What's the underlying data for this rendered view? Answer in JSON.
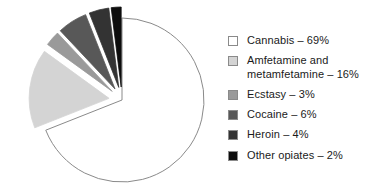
{
  "chart_data": {
    "type": "pie",
    "title": "",
    "subtitle": "",
    "xlabel": "",
    "ylabel": "",
    "legend_position": "right",
    "grid": false,
    "units": "percent",
    "total": 100,
    "categories": [
      "Cannabis",
      "Amfetamine and metamfetamine",
      "Ecstasy",
      "Cocaine",
      "Heroin",
      "Other opiates"
    ],
    "values": [
      69,
      16,
      3,
      6,
      4,
      2
    ],
    "value_labels": [
      "69%",
      "16%",
      "3%",
      "6%",
      "4%",
      "2%"
    ],
    "colors": [
      "#ffffff",
      "#d4d4d4",
      "#9a9a9a",
      "#585858",
      "#333333",
      "#0d0d0d"
    ],
    "slices": [
      {
        "name": "Cannabis",
        "value": 69,
        "value_label": "69%",
        "color": "#ffffff",
        "exploded": false,
        "start_angle": 0,
        "end_angle": 248.4
      },
      {
        "name": "Amfetamine and metamfetamine",
        "value": 16,
        "value_label": "16%",
        "color": "#d4d4d4",
        "exploded": true,
        "start_angle": 248.4,
        "end_angle": 306.0
      },
      {
        "name": "Ecstasy",
        "value": 3,
        "value_label": "3%",
        "color": "#9a9a9a",
        "exploded": true,
        "start_angle": 306.0,
        "end_angle": 316.8
      },
      {
        "name": "Cocaine",
        "value": 6,
        "value_label": "6%",
        "color": "#585858",
        "exploded": true,
        "start_angle": 316.8,
        "end_angle": 338.4
      },
      {
        "name": "Heroin",
        "value": 4,
        "value_label": "4%",
        "color": "#333333",
        "exploded": true,
        "start_angle": 338.4,
        "end_angle": 352.8
      },
      {
        "name": "Other opiates",
        "value": 2,
        "value_label": "2%",
        "color": "#0d0d0d",
        "exploded": true,
        "start_angle": 352.8,
        "end_angle": 360.0
      }
    ]
  },
  "legend": {
    "items": [
      {
        "label": "Cannabis – 69%",
        "color": "#ffffff"
      },
      {
        "label": "Amfetamine and\nmetamfetamine – 16%",
        "color": "#d4d4d4"
      },
      {
        "label": "Ecstasy – 3%",
        "color": "#9a9a9a"
      },
      {
        "label": "Cocaine – 6%",
        "color": "#585858"
      },
      {
        "label": "Heroin – 4%",
        "color": "#333333"
      },
      {
        "label": "Other opiates – 2%",
        "color": "#0d0d0d"
      }
    ]
  }
}
